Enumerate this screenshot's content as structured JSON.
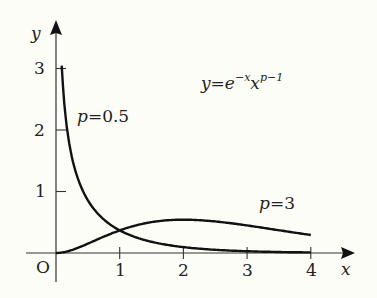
{
  "chart_data": {
    "type": "line",
    "xlabel": "x",
    "ylabel": "y",
    "origin_label": "O",
    "xlim": [
      0,
      4.5
    ],
    "ylim": [
      0,
      3.4
    ],
    "x_ticks": [
      1,
      2,
      3,
      4
    ],
    "y_ticks": [
      1,
      2,
      3
    ],
    "grid": false,
    "legend": "none (inline curve labels)",
    "formula": {
      "base": "y=e",
      "exp1": "−x",
      "mid": "x",
      "exp2": "p−1"
    },
    "series": [
      {
        "name": "p=0.5",
        "label_var": "p",
        "label_val": "=0.5",
        "function": "e^{-x} x^{-0.5}",
        "x": [
          0.085,
          0.1,
          0.15,
          0.2,
          0.3,
          0.5,
          0.75,
          1,
          1.5,
          2,
          2.5,
          3,
          3.5,
          4
        ],
        "values": [
          3.15,
          2.86,
          2.22,
          1.83,
          1.35,
          0.86,
          0.55,
          0.37,
          0.18,
          0.1,
          0.05,
          0.03,
          0.02,
          0.01
        ]
      },
      {
        "name": "p=3",
        "label_var": "p",
        "label_val": "=3",
        "function": "x^2 e^{-x}",
        "x": [
          0,
          0.5,
          1,
          1.5,
          2,
          2.5,
          3,
          3.5,
          4
        ],
        "values": [
          0,
          0.15,
          0.37,
          0.5,
          0.54,
          0.51,
          0.45,
          0.37,
          0.29
        ]
      }
    ]
  }
}
